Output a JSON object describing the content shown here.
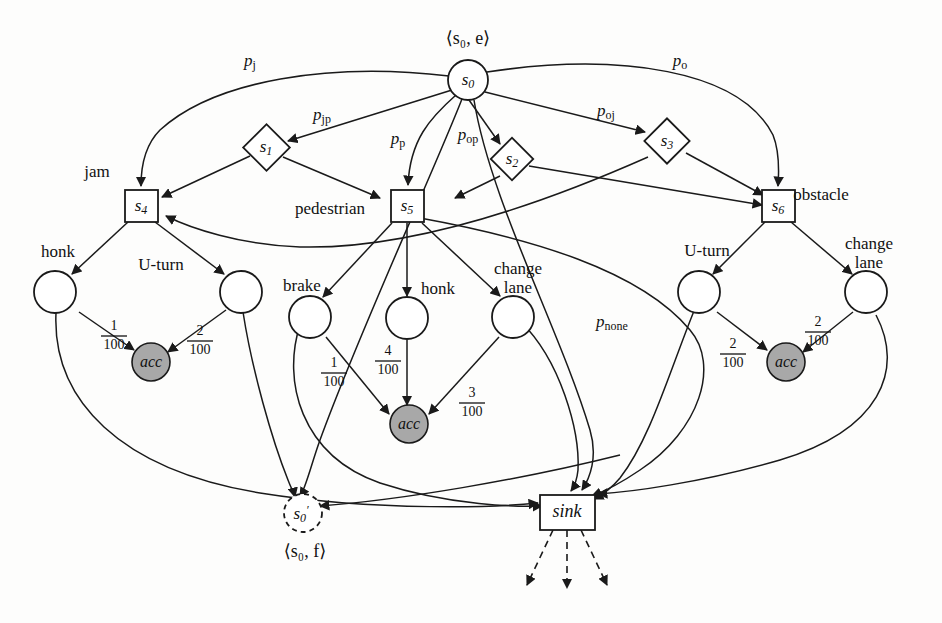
{
  "diagram": {
    "width": 942,
    "height": 623,
    "colors": {
      "stroke": "#1a1a1a",
      "accident_fill": "#a8a8a8",
      "node_fill": "#ffffff",
      "background": "#fdfdfc"
    }
  },
  "config_labels": {
    "initial": "⟨s₀, e⟩",
    "final": "⟨s₀, f⟩"
  },
  "nodes": {
    "s0": {
      "label": "s",
      "sub": "0",
      "type": "circle"
    },
    "s1": {
      "label": "s",
      "sub": "1",
      "type": "diamond"
    },
    "s2": {
      "label": "s",
      "sub": "2",
      "type": "diamond"
    },
    "s3": {
      "label": "s",
      "sub": "3",
      "type": "diamond"
    },
    "s4": {
      "label": "s",
      "sub": "4",
      "type": "square"
    },
    "s5": {
      "label": "s",
      "sub": "5",
      "type": "square"
    },
    "s6": {
      "label": "s",
      "sub": "6",
      "type": "square"
    },
    "s0_final": {
      "label": "s",
      "sub": "0",
      "prime": "′",
      "type": "dashed-circle"
    },
    "sink": {
      "label": "sink",
      "type": "square"
    },
    "acc_left": {
      "label": "acc",
      "type": "filled-circle"
    },
    "acc_mid": {
      "label": "acc",
      "type": "filled-circle"
    },
    "acc_right": {
      "label": "acc",
      "type": "filled-circle"
    },
    "act_jam_honk": {
      "label": "",
      "type": "circle"
    },
    "act_jam_uturn": {
      "label": "",
      "type": "circle"
    },
    "act_ped_brake": {
      "label": "",
      "type": "circle"
    },
    "act_ped_honk": {
      "label": "",
      "type": "circle"
    },
    "act_ped_changelane": {
      "label": "",
      "type": "circle"
    },
    "act_obs_uturn": {
      "label": "",
      "type": "circle"
    },
    "act_obs_changelane": {
      "label": "",
      "type": "circle"
    }
  },
  "state_labels": [
    {
      "key": "jam",
      "text": "jam"
    },
    {
      "key": "pedestrian",
      "text": "pedestrian"
    },
    {
      "key": "obstacle",
      "text": "obstacle"
    }
  ],
  "action_labels": [
    {
      "key": "jam-honk",
      "text": "honk"
    },
    {
      "key": "jam-uturn",
      "text": "U-turn"
    },
    {
      "key": "ped-brake",
      "text": "brake"
    },
    {
      "key": "ped-honk",
      "text": "honk"
    },
    {
      "key": "ped-changelane-line1",
      "text": "change"
    },
    {
      "key": "ped-changelane-line2",
      "text": "lane"
    },
    {
      "key": "obs-uturn",
      "text": "U-turn"
    },
    {
      "key": "obs-changelane-line1",
      "text": "change"
    },
    {
      "key": "obs-changelane-line2",
      "text": "lane"
    }
  ],
  "probability_labels": [
    {
      "key": "p_j",
      "base": "p",
      "sub": "j"
    },
    {
      "key": "p_jp",
      "base": "p",
      "sub": "jp"
    },
    {
      "key": "p_p",
      "base": "p",
      "sub": "p"
    },
    {
      "key": "p_op",
      "base": "p",
      "sub": "op"
    },
    {
      "key": "p_oj",
      "base": "p",
      "sub": "oj"
    },
    {
      "key": "p_o",
      "base": "p",
      "sub": "o"
    },
    {
      "key": "p_none",
      "base": "p",
      "sub": "none"
    }
  ],
  "fractions": [
    {
      "key": "jam-honk-acc",
      "num": "1",
      "den": "100"
    },
    {
      "key": "jam-uturn-acc",
      "num": "2",
      "den": "100"
    },
    {
      "key": "ped-brake-acc",
      "num": "1",
      "den": "100"
    },
    {
      "key": "ped-honk-acc",
      "num": "4",
      "den": "100"
    },
    {
      "key": "ped-changelane-acc",
      "num": "3",
      "den": "100"
    },
    {
      "key": "obs-uturn-acc",
      "num": "2",
      "den": "100"
    },
    {
      "key": "obs-changelane-acc",
      "num": "2",
      "den": "100"
    }
  ]
}
